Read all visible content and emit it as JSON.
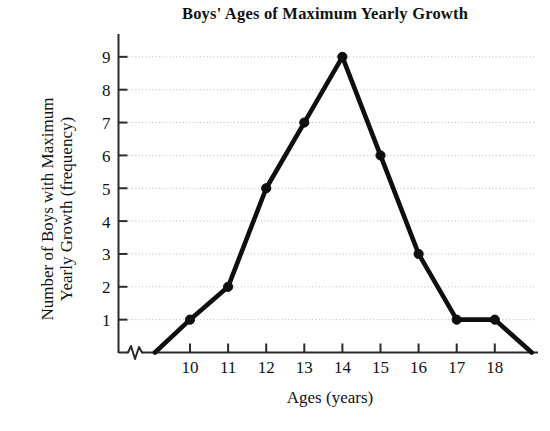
{
  "chart_data": {
    "type": "line",
    "title": "Boys' Ages of Maximum Yearly Growth",
    "xlabel": "Ages (years)",
    "ylabel_line1": "Number of Boys with Maximum",
    "ylabel_line2": "Yearly Growth (frequency)",
    "ylabel": "Number of Boys with Maximum Yearly Growth (frequency)",
    "categories": [
      10,
      11,
      12,
      13,
      14,
      15,
      16,
      17,
      18
    ],
    "x": [
      10,
      11,
      12,
      13,
      14,
      15,
      16,
      17,
      18
    ],
    "values": [
      1,
      2,
      5,
      7,
      9,
      6,
      3,
      1,
      1
    ],
    "xtick_labels": [
      "10",
      "11",
      "12",
      "13",
      "14",
      "15",
      "16",
      "17",
      "18"
    ],
    "ytick_labels": [
      "1",
      "2",
      "3",
      "4",
      "5",
      "6",
      "7",
      "8",
      "9"
    ],
    "ytick_values": [
      1,
      2,
      3,
      4,
      5,
      6,
      7,
      8,
      9
    ],
    "xlim": [
      9.05,
      19.85
    ],
    "ylim": [
      0,
      9.9
    ],
    "grid": true,
    "grid_style": "dotted",
    "grid_color": "#b9b9b9",
    "legend": null,
    "legend_position": "none",
    "line_color": "#0f0f0f",
    "marker": "circle",
    "marker_color": "#0f0f0f",
    "axis_break": "x-axis zigzag near origin",
    "annotations": [
      "Line descends to the horizontal axis before age 10 and after age 18",
      "Frequency polygon with closed endpoints at zero"
    ]
  },
  "figure": {
    "background": "#ffffff",
    "axis_color": "#2b2b2b"
  }
}
